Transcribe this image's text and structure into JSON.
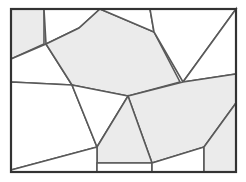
{
  "figure": {
    "type": "geometric-diagram",
    "canvas": {
      "width": 246,
      "height": 182
    },
    "colors": {
      "background": "#ffffff",
      "fill_shaded": "#ebebeb",
      "fill_blank": "#ffffff",
      "edge": "#595959",
      "frame": "#333333"
    },
    "frame": {
      "x": 11,
      "y": 9,
      "width": 225,
      "height": 163
    },
    "cells": [
      {
        "id": "cell-top-left-strip",
        "shade": "filled",
        "points": "11,9 44,9 44,44 11,59"
      },
      {
        "id": "cell-top-left-notch",
        "shade": "blank",
        "points": "44,9 100,9 79,28 46,44"
      },
      {
        "id": "cell-left-triangle",
        "shade": "blank",
        "points": "11,59 46,44 72,85 11,82"
      },
      {
        "id": "cell-central-large",
        "shade": "filled",
        "points": "46,44 79,28 100,9 154,32 180,82 128,96 72,85"
      },
      {
        "id": "cell-top-mid-gap",
        "shade": "blank",
        "points": "100,9 150,9 154,32"
      },
      {
        "id": "cell-top-right-wedge",
        "shade": "blank",
        "points": "150,9 236,9 183,82 154,32"
      },
      {
        "id": "cell-right-upper-wedge",
        "shade": "blank",
        "points": "236,9 236,74 183,82"
      },
      {
        "id": "cell-lower-right-large",
        "shade": "filled",
        "points": "183,82 236,74 236,103 204,147 152,163 128,96"
      },
      {
        "id": "cell-mid-left-wedge",
        "shade": "blank",
        "points": "11,82 72,85 97,147 11,170"
      },
      {
        "id": "cell-center-quad",
        "shade": "blank",
        "points": "72,85 128,96 97,147"
      },
      {
        "id": "cell-bottom-center",
        "shade": "filled",
        "points": "97,147 128,96 152,163 97,163"
      },
      {
        "id": "cell-bottom-left-sliver",
        "shade": "blank",
        "points": "11,170 97,147 97,172 11,172"
      },
      {
        "id": "cell-bottom-mid-sliver",
        "shade": "blank",
        "points": "97,163 152,163 152,172 97,172"
      },
      {
        "id": "cell-bottom-right-sliver",
        "shade": "blank",
        "points": "152,163 204,147 204,172 152,172"
      },
      {
        "id": "cell-right-bottom-strip",
        "shade": "filled",
        "points": "204,147 236,103 236,172 204,172"
      }
    ]
  }
}
